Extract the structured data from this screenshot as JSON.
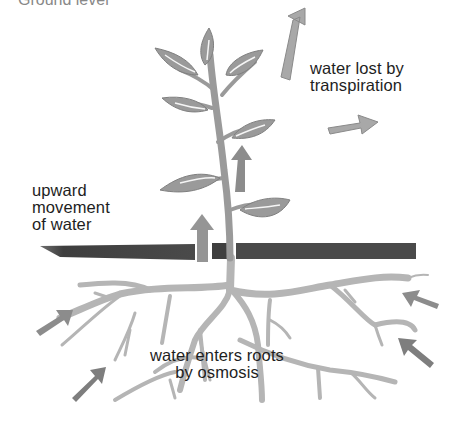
{
  "header": {
    "cropped_text": "Ground level"
  },
  "diagram": {
    "labels": {
      "transpiration": [
        "water lost by",
        "transpiration"
      ],
      "upward": [
        "upward",
        "movement",
        "of water"
      ],
      "osmosis": [
        "water enters roots",
        "by osmosis"
      ]
    },
    "colors": {
      "plant": "#9a9a9a",
      "arrow": "#8c8c8c",
      "arrow_light": "#b0b0b0",
      "soil": "#4a4a4a",
      "roots": "#b8b8b8",
      "text": "#1e1e1e"
    }
  }
}
